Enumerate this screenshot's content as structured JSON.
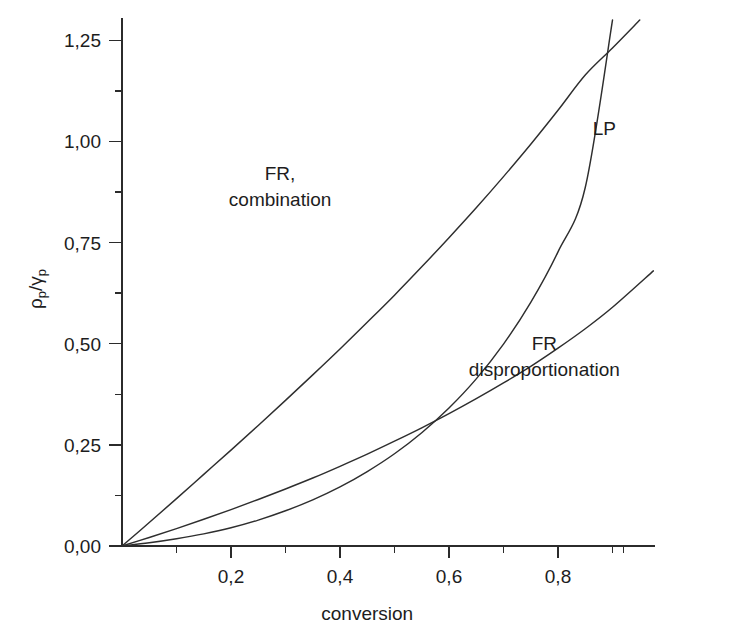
{
  "chart_data": {
    "type": "line",
    "title": "",
    "xlabel": "conversion",
    "ylabel": "ρp/γp",
    "xlim": [
      0,
      0.975
    ],
    "ylim": [
      0,
      1.3
    ],
    "grid": false,
    "legend_position": "inline-annotations",
    "decimal_separator": ",",
    "x_ticks_major": [
      0.2,
      0.4,
      0.6,
      0.8
    ],
    "x_tick_labels": [
      "0,2",
      "0,4",
      "0,6",
      "0,8"
    ],
    "x_ticks_minor": [
      0.1,
      0.3,
      0.5,
      0.7,
      0.9
    ],
    "y_ticks_major": [
      0.0,
      0.25,
      0.5,
      0.75,
      1.0,
      1.25
    ],
    "y_tick_labels": [
      "0,00",
      "0,25",
      "0,50",
      "0,75",
      "1,00",
      "1,25"
    ],
    "y_ticks_minor": [
      0.125,
      0.375,
      0.625,
      0.875,
      1.125
    ],
    "series": [
      {
        "name": "FR, combination",
        "label": "FR,\ncombination",
        "color": "#2e2e2e",
        "x": [
          0.0,
          0.05,
          0.1,
          0.15,
          0.2,
          0.25,
          0.3,
          0.35,
          0.4,
          0.45,
          0.5,
          0.55,
          0.6,
          0.65,
          0.7,
          0.75,
          0.8,
          0.85,
          0.9,
          0.95
        ],
        "y": [
          0.0,
          0.058,
          0.117,
          0.177,
          0.237,
          0.298,
          0.36,
          0.423,
          0.487,
          0.553,
          0.62,
          0.69,
          0.762,
          0.836,
          0.913,
          0.993,
          1.077,
          1.164,
          1.231,
          1.3
        ]
      },
      {
        "name": "LP",
        "label": "LP",
        "color": "#2e2e2e",
        "x": [
          0.0,
          0.05,
          0.1,
          0.15,
          0.2,
          0.25,
          0.3,
          0.35,
          0.4,
          0.45,
          0.5,
          0.55,
          0.6,
          0.65,
          0.7,
          0.75,
          0.8,
          0.85,
          0.9
        ],
        "y": [
          0.0,
          0.008,
          0.018,
          0.03,
          0.045,
          0.064,
          0.087,
          0.114,
          0.146,
          0.184,
          0.228,
          0.28,
          0.341,
          0.413,
          0.499,
          0.602,
          0.727,
          0.886,
          1.3
        ]
      },
      {
        "name": "FR disproportionation",
        "label": "FR\ndisproportionation",
        "color": "#2e2e2e",
        "x": [
          0.0,
          0.05,
          0.1,
          0.15,
          0.2,
          0.25,
          0.3,
          0.35,
          0.4,
          0.45,
          0.5,
          0.55,
          0.6,
          0.65,
          0.7,
          0.75,
          0.8,
          0.85,
          0.9,
          0.975
        ],
        "y": [
          0.0,
          0.021,
          0.043,
          0.066,
          0.09,
          0.115,
          0.141,
          0.168,
          0.197,
          0.227,
          0.259,
          0.292,
          0.327,
          0.364,
          0.403,
          0.444,
          0.489,
          0.537,
          0.59,
          0.68
        ]
      }
    ],
    "annotations": [
      {
        "name": "fr-combination",
        "text_lines": [
          "FR,",
          "combination"
        ],
        "x": 0.29,
        "y": 0.905
      },
      {
        "name": "lp",
        "text_lines": [
          "LP"
        ],
        "x": 0.885,
        "y": 1.015
      },
      {
        "name": "fr-disproportionation",
        "text_lines": [
          "FR",
          "disproportionation"
        ],
        "x": 0.775,
        "y": 0.485
      }
    ]
  }
}
